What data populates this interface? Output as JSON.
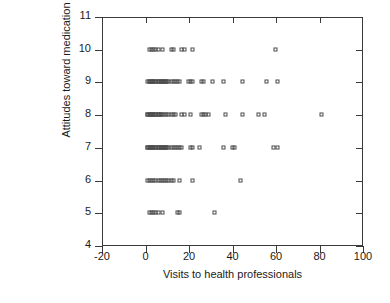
{
  "chart_data": {
    "type": "scatter",
    "title": "",
    "xlabel": "Visits to health professionals",
    "ylabel": "Attitudes toward medication",
    "xlim": [
      -20,
      100
    ],
    "ylim": [
      4,
      11
    ],
    "xticks": [
      -20,
      0,
      20,
      40,
      60,
      80,
      100
    ],
    "yticks": [
      4,
      5,
      6,
      7,
      8,
      9,
      10,
      11
    ],
    "xtick_labels": [
      "-20",
      "0",
      "20",
      "40",
      "60",
      "80",
      "100"
    ],
    "ytick_labels": [
      "4",
      "5",
      "6",
      "7",
      "8",
      "9",
      "10",
      "11"
    ],
    "grid": false,
    "legend": null,
    "marker": "open-square",
    "marker_color": "#4a4a4a",
    "series": [
      {
        "name": "respondents",
        "points": [
          [
            2,
            10
          ],
          [
            3,
            10
          ],
          [
            4,
            10
          ],
          [
            5,
            10
          ],
          [
            6,
            10
          ],
          [
            8,
            10
          ],
          [
            12,
            10
          ],
          [
            13,
            10
          ],
          [
            17,
            10
          ],
          [
            18,
            10
          ],
          [
            22,
            10
          ],
          [
            60,
            10
          ],
          [
            1,
            9
          ],
          [
            2,
            9
          ],
          [
            2,
            9
          ],
          [
            3,
            9
          ],
          [
            3,
            9
          ],
          [
            4,
            9
          ],
          [
            4,
            9
          ],
          [
            5,
            9
          ],
          [
            5,
            9
          ],
          [
            6,
            9
          ],
          [
            6,
            9
          ],
          [
            7,
            9
          ],
          [
            7,
            9
          ],
          [
            8,
            9
          ],
          [
            8,
            9
          ],
          [
            9,
            9
          ],
          [
            9,
            9
          ],
          [
            10,
            9
          ],
          [
            10,
            9
          ],
          [
            11,
            9
          ],
          [
            12,
            9
          ],
          [
            13,
            9
          ],
          [
            14,
            9
          ],
          [
            15,
            9
          ],
          [
            16,
            9
          ],
          [
            20,
            9
          ],
          [
            21,
            9
          ],
          [
            22,
            9
          ],
          [
            26,
            9
          ],
          [
            27,
            9
          ],
          [
            31,
            9
          ],
          [
            36,
            9
          ],
          [
            45,
            9
          ],
          [
            56,
            9
          ],
          [
            61,
            9
          ],
          [
            1,
            8
          ],
          [
            1,
            8
          ],
          [
            2,
            8
          ],
          [
            2,
            8
          ],
          [
            3,
            8
          ],
          [
            3,
            8
          ],
          [
            4,
            8
          ],
          [
            4,
            8
          ],
          [
            5,
            8
          ],
          [
            5,
            8
          ],
          [
            6,
            8
          ],
          [
            6,
            8
          ],
          [
            7,
            8
          ],
          [
            7,
            8
          ],
          [
            8,
            8
          ],
          [
            9,
            8
          ],
          [
            10,
            8
          ],
          [
            11,
            8
          ],
          [
            12,
            8
          ],
          [
            13,
            8
          ],
          [
            14,
            8
          ],
          [
            17,
            8
          ],
          [
            18,
            8
          ],
          [
            21,
            8
          ],
          [
            26,
            8
          ],
          [
            27,
            8
          ],
          [
            28,
            8
          ],
          [
            29,
            8
          ],
          [
            37,
            8
          ],
          [
            45,
            8
          ],
          [
            52,
            8
          ],
          [
            55,
            8
          ],
          [
            81,
            8
          ],
          [
            1,
            7
          ],
          [
            1,
            7
          ],
          [
            2,
            7
          ],
          [
            2,
            7
          ],
          [
            3,
            7
          ],
          [
            3,
            7
          ],
          [
            4,
            7
          ],
          [
            4,
            7
          ],
          [
            5,
            7
          ],
          [
            5,
            7
          ],
          [
            6,
            7
          ],
          [
            6,
            7
          ],
          [
            7,
            7
          ],
          [
            7,
            7
          ],
          [
            8,
            7
          ],
          [
            8,
            7
          ],
          [
            9,
            7
          ],
          [
            9,
            7
          ],
          [
            10,
            7
          ],
          [
            10,
            7
          ],
          [
            11,
            7
          ],
          [
            12,
            7
          ],
          [
            13,
            7
          ],
          [
            14,
            7
          ],
          [
            15,
            7
          ],
          [
            16,
            7
          ],
          [
            17,
            7
          ],
          [
            21,
            7
          ],
          [
            22,
            7
          ],
          [
            25,
            7
          ],
          [
            36,
            7
          ],
          [
            40,
            7
          ],
          [
            41,
            7
          ],
          [
            59,
            7
          ],
          [
            61,
            7
          ],
          [
            1,
            6
          ],
          [
            2,
            6
          ],
          [
            3,
            6
          ],
          [
            4,
            6
          ],
          [
            5,
            6
          ],
          [
            6,
            6
          ],
          [
            7,
            6
          ],
          [
            8,
            6
          ],
          [
            9,
            6
          ],
          [
            10,
            6
          ],
          [
            11,
            6
          ],
          [
            12,
            6
          ],
          [
            13,
            6
          ],
          [
            16,
            6
          ],
          [
            22,
            6
          ],
          [
            44,
            6
          ],
          [
            2,
            5
          ],
          [
            3,
            5
          ],
          [
            4,
            5
          ],
          [
            5,
            5
          ],
          [
            6,
            5
          ],
          [
            8,
            5
          ],
          [
            15,
            5
          ],
          [
            16,
            5
          ],
          [
            32,
            5
          ]
        ]
      }
    ]
  }
}
